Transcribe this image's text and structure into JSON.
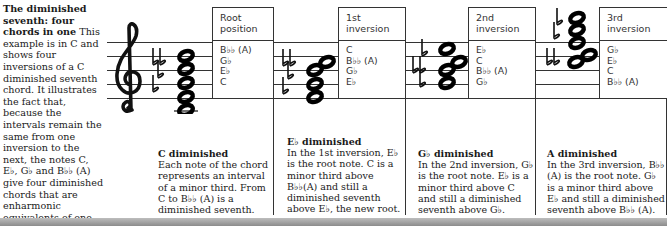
{
  "intro": {
    "title": "The diminished seventh: four chords in one",
    "body": "This example is in C and shows four inversions of a C diminished seventh chord. It illustrates the fact that, because the intervals remain the same from one inversion to the next, the notes C, E♭, G♭ and B♭♭ (A) give four diminished chords that are enharmonic equivalents of one another: they all share the same four notes."
  },
  "inversions": [
    {
      "heading_line1": "Root",
      "heading_line2": "position",
      "notes": [
        "B♭♭ (A)",
        "G♭",
        "E♭",
        "C"
      ],
      "caption_title": "C diminished",
      "caption_text": "Each note of the chord represents an interval of a minor third. From C to B♭♭ (A) is a diminished seventh."
    },
    {
      "heading_line1": "1st",
      "heading_line2": "inversion",
      "notes": [
        "C",
        "B♭♭ (A)",
        "G♭",
        "E♭"
      ],
      "caption_title": "E♭ diminished",
      "caption_text": "In the 1st inversion, E♭ is the root note. C is a minor third above B♭♭(A) and still a diminished seventh above E♭, the new root."
    },
    {
      "heading_line1": "2nd",
      "heading_line2": "inversion",
      "notes": [
        "E♭",
        "C",
        "B♭♭ (A)",
        "G♭"
      ],
      "caption_title": "G♭ diminished",
      "caption_text": "In the 2nd inversion, G♭ is the root note. E♭ is a minor third above C and still a diminished seventh above G♭."
    },
    {
      "heading_line1": "3rd",
      "heading_line2": "inversion",
      "notes": [
        "G♭",
        "E♭",
        "C",
        "B♭♭ (A)"
      ],
      "caption_title": "A diminished",
      "caption_text": "In the 3rd inversion, B♭♭ (A) is the root note. G♭ is a minor third above E♭ and still a diminished seventh above B♭♭ (A)."
    }
  ],
  "icons": {
    "clef": "treble-clef-icon",
    "flat": "flat-icon",
    "double_flat": "double-flat-icon",
    "note": "whole-note-icon"
  }
}
